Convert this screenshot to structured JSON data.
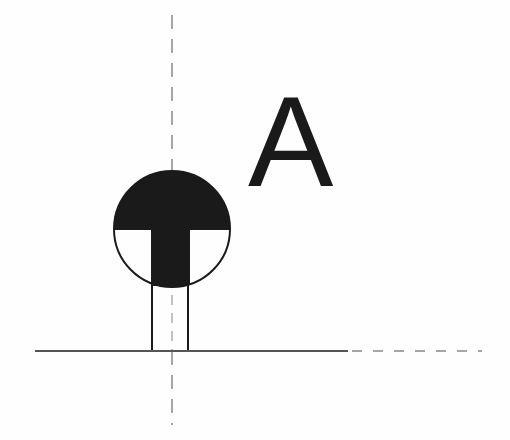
{
  "diagram": {
    "type": "section-marker-symbol",
    "label": "A",
    "colors": {
      "background": "#fefefe",
      "ink": "#1a1a1a",
      "line": "#555555",
      "dash": "#777777"
    },
    "symbol": {
      "center_x": 172,
      "center_y": 229,
      "radius": 58,
      "upper_half": "filled",
      "lower_half": "T-shaped fill",
      "stem": {
        "x1": 152,
        "x2": 188,
        "y_top": 287,
        "y_bottom": 351
      }
    },
    "axis_vertical": {
      "x": 172,
      "y1": 15,
      "y2": 425,
      "style": "dashed"
    },
    "baseline": {
      "y": 351,
      "solid_x1": 35,
      "solid_x2": 348,
      "dashed_x2": 482
    }
  }
}
